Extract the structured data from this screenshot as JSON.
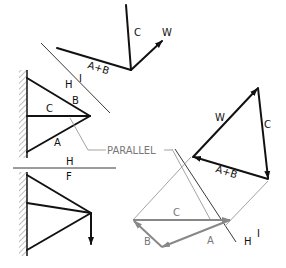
{
  "diagram": {
    "title": "",
    "colors": {
      "primary": "#111111",
      "construction": "#888888",
      "background": "#ffffff"
    },
    "space_diagram_top": {
      "labels": {
        "top_member": "B",
        "middle_member": "C",
        "bottom_member": "A",
        "line_H": "H",
        "line_I": "I"
      }
    },
    "separator": {
      "label_above": "H",
      "label_below": "F"
    },
    "vector_sketch": {
      "label_C": "C",
      "label_W": "W",
      "label_AB": "A+B"
    },
    "force_triangle": {
      "label_W": "W",
      "label_C": "C",
      "label_AB": "A+B"
    },
    "construction": {
      "parallel_label": "PARALLEL",
      "label_C": "C",
      "label_B": "B",
      "label_A": "A",
      "label_H": "H",
      "label_I": "I"
    }
  }
}
